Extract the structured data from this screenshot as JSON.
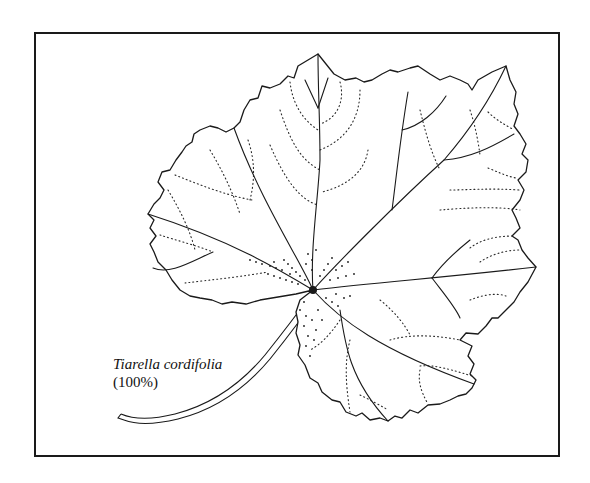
{
  "figure": {
    "caption": {
      "species": "Tiarella cordifolia",
      "scale": "(100%)"
    },
    "colors": {
      "ink": "#1a1a1a",
      "paper": "#ffffff"
    }
  }
}
